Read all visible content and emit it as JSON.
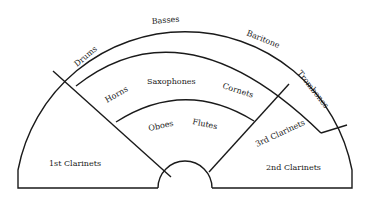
{
  "diagram": {
    "type": "band seating chart",
    "colors": {
      "line": "#1a1a1a",
      "background": "#ffffff"
    },
    "sections": {
      "drums": "Drums",
      "basses": "Basses",
      "baritone": "Baritone",
      "trombones": "Trombones",
      "horns": "Horns",
      "saxophones": "Saxophones",
      "cornets": "Cornets",
      "oboes": "Oboes",
      "flutes": "Flutes",
      "first_clarinets": "1st Clarinets",
      "second_clarinets": "2nd Clarinets",
      "third_clarinets": "3rd Clarinets"
    }
  }
}
